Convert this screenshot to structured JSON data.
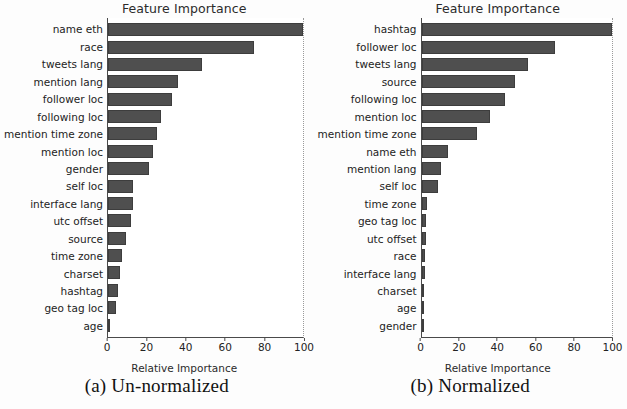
{
  "figure": {
    "background": "#fdfdfd",
    "bar_color": "#4f4f4f",
    "axis_color": "#4a4a4a"
  },
  "panels": [
    {
      "key": "unnormalized",
      "caption": "(a) Un-normalized",
      "chart_data": {
        "type": "bar",
        "orientation": "horizontal",
        "title": "Feature Importance",
        "xlabel": "Relative Importance",
        "ylabel": "",
        "xlim": [
          0,
          100
        ],
        "xticks": [
          0,
          20,
          40,
          60,
          80,
          100
        ],
        "grid": false,
        "legend": null,
        "categories": [
          "name eth",
          "race",
          "tweets lang",
          "mention lang",
          "follower loc",
          "following loc",
          "mention time zone",
          "mention loc",
          "gender",
          "self loc",
          "interface lang",
          "utc offset",
          "source",
          "time zone",
          "charset",
          "hashtag",
          "geo tag loc",
          "age"
        ],
        "values": [
          100,
          75,
          48,
          36,
          33,
          27,
          25,
          23,
          21,
          13,
          13,
          12,
          9,
          7,
          6,
          5,
          4,
          1
        ]
      }
    },
    {
      "key": "normalized",
      "caption": "(b) Normalized",
      "chart_data": {
        "type": "bar",
        "orientation": "horizontal",
        "title": "Feature Importance",
        "xlabel": "Relative Importance",
        "ylabel": "",
        "xlim": [
          0,
          100
        ],
        "xticks": [
          0,
          20,
          40,
          60,
          80,
          100
        ],
        "grid": false,
        "legend": null,
        "categories": [
          "hashtag",
          "follower loc",
          "tweets lang",
          "source",
          "following loc",
          "mention loc",
          "mention time zone",
          "name eth",
          "mention lang",
          "self loc",
          "time zone",
          "geo tag loc",
          "utc offset",
          "race",
          "interface lang",
          "charset",
          "age",
          "gender"
        ],
        "values": [
          100,
          70,
          56,
          49,
          44,
          36,
          29,
          14,
          10,
          8.5,
          3,
          2.4,
          2.2,
          2,
          1.6,
          0.8,
          0.5,
          0.3
        ]
      }
    }
  ]
}
